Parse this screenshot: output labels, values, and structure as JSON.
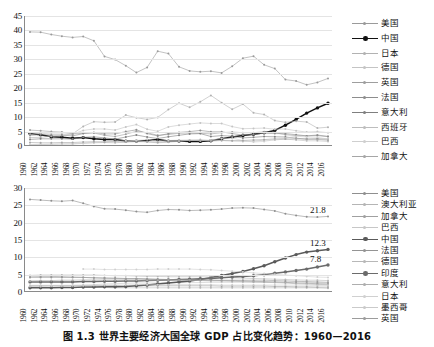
{
  "caption": "图 1.3    世界主要经济大国全球 GDP 占比变化趋势：1960—2016",
  "chart_data": [
    {
      "type": "line",
      "id": "chart-top",
      "title": "",
      "xlabel": "",
      "ylabel": "",
      "xlim": [
        1960,
        2016
      ],
      "ylim": [
        0,
        45
      ],
      "ytick_step": 5,
      "yticks": [
        "0",
        "5",
        "10",
        "15",
        "20",
        "25",
        "30",
        "35",
        "40",
        "45"
      ],
      "grid": true,
      "legend_position": "right",
      "x": [
        1960,
        1962,
        1964,
        1966,
        1968,
        1970,
        1972,
        1974,
        1976,
        1978,
        1980,
        1982,
        1984,
        1986,
        1988,
        1990,
        1992,
        1994,
        1996,
        1998,
        2000,
        2002,
        2004,
        2006,
        2008,
        2010,
        2012,
        2014,
        2016
      ],
      "xtick_labels": [
        "1960",
        "1962",
        "1964",
        "1966",
        "1968",
        "1970",
        "1972",
        "1974",
        "1976",
        "1978",
        "1980",
        "1982",
        "1984",
        "1986",
        "1988",
        "1990",
        "1992",
        "1994",
        "1996",
        "1998",
        "2000",
        "2002",
        "2004",
        "2006",
        "2008",
        "2010",
        "2012",
        "2014",
        "2016"
      ],
      "series": [
        {
          "name": "美国",
          "color": "#9a9a9a",
          "emphasis": false,
          "values": [
            39.5,
            39.4,
            38.6,
            38.0,
            37.6,
            37.9,
            36.4,
            31.0,
            29.9,
            27.8,
            25.4,
            27.2,
            32.8,
            32.0,
            27.4,
            26.0,
            25.7,
            25.9,
            25.3,
            27.6,
            30.4,
            31.1,
            28.1,
            26.8,
            23.0,
            22.5,
            21.2,
            22.0,
            23.4
          ]
        },
        {
          "name": "中国",
          "color": "#111111",
          "emphasis": true,
          "values": [
            4.3,
            3.9,
            3.2,
            3.0,
            2.7,
            2.9,
            2.5,
            2.3,
            2.2,
            1.7,
            1.7,
            1.9,
            2.2,
            1.7,
            1.7,
            1.6,
            1.6,
            1.8,
            2.5,
            3.1,
            3.6,
            4.1,
            4.6,
            5.4,
            7.2,
            9.2,
            11.4,
            13.2,
            14.8
          ]
        },
        {
          "name": "日本",
          "color": "#b2b2b2",
          "emphasis": false,
          "values": [
            2.9,
            3.0,
            3.4,
            3.6,
            4.2,
            6.8,
            8.4,
            8.2,
            8.3,
            10.7,
            9.8,
            9.2,
            9.9,
            12.6,
            14.8,
            13.4,
            15.3,
            17.5,
            15.0,
            12.7,
            14.5,
            11.5,
            10.9,
            8.8,
            8.2,
            8.6,
            8.3,
            6.2,
            6.5
          ]
        },
        {
          "name": "德国",
          "color": "#c4c4c4",
          "emphasis": false,
          "values": [
            4.1,
            4.4,
            4.2,
            4.2,
            4.0,
            5.4,
            5.9,
            5.9,
            5.5,
            6.6,
            7.4,
            5.8,
            5.1,
            6.6,
            7.2,
            7.6,
            8.0,
            7.8,
            7.8,
            6.7,
            6.0,
            6.1,
            6.2,
            5.8,
            5.9,
            5.3,
            4.8,
            5.0,
            4.6
          ]
        },
        {
          "name": "英国",
          "color": "#9e9e9e",
          "emphasis": false,
          "values": [
            5.5,
            5.3,
            5.0,
            4.8,
            4.2,
            4.4,
            4.5,
            3.7,
            3.3,
            4.1,
            5.1,
            4.6,
            3.7,
            4.0,
            4.4,
            4.5,
            4.4,
            4.2,
            4.6,
            4.8,
            4.6,
            4.6,
            4.9,
            4.6,
            3.9,
            3.6,
            3.5,
            3.8,
            3.3
          ]
        },
        {
          "name": "法国",
          "color": "#8d8d8d",
          "emphasis": false,
          "values": [
            3.7,
            3.9,
            3.8,
            3.8,
            3.5,
            4.3,
            4.7,
            4.2,
            4.2,
            5.0,
            5.6,
            4.3,
            3.5,
            4.3,
            4.7,
            5.0,
            5.4,
            4.9,
            4.9,
            4.3,
            3.8,
            4.0,
            4.4,
            4.3,
            4.3,
            3.9,
            3.5,
            3.6,
            3.3
          ]
        },
        {
          "name": "意大利",
          "color": "#7f7f7f",
          "emphasis": false,
          "values": [
            2.3,
            2.5,
            2.5,
            2.5,
            2.4,
            3.0,
            3.2,
            2.8,
            2.4,
            3.1,
            3.8,
            3.1,
            2.6,
            3.2,
            3.7,
            4.2,
            4.3,
            3.3,
            3.6,
            3.4,
            2.8,
            3.0,
            3.3,
            3.2,
            3.1,
            2.7,
            2.4,
            2.5,
            2.4
          ]
        },
        {
          "name": "西班牙",
          "color": "#bdbdbd",
          "emphasis": false,
          "values": [
            0.4,
            0.5,
            0.6,
            0.7,
            0.7,
            0.9,
            1.1,
            1.2,
            1.1,
            1.4,
            1.9,
            1.4,
            1.1,
            1.3,
            1.6,
            2.0,
            2.2,
            1.8,
            1.9,
            1.8,
            1.6,
            1.7,
            2.0,
            2.1,
            2.4,
            2.1,
            1.8,
            1.8,
            1.6
          ]
        },
        {
          "name": "巴西",
          "color": "#cfcfcf",
          "emphasis": false,
          "values": [
            0.5,
            0.6,
            0.6,
            0.7,
            0.8,
            1.0,
            1.2,
            1.5,
            1.6,
            1.8,
            1.9,
            2.2,
            1.6,
            1.9,
            2.0,
            2.1,
            1.8,
            2.1,
            2.6,
            2.7,
            1.9,
            1.4,
            1.6,
            2.2,
            2.7,
            3.4,
            3.1,
            3.0,
            2.4
          ]
        },
        {
          "name": "加拿大",
          "color": "#a6a6a6",
          "emphasis": false,
          "values": [
            1.2,
            1.1,
            1.1,
            1.2,
            1.2,
            1.4,
            1.5,
            1.4,
            1.5,
            1.4,
            1.5,
            1.5,
            1.3,
            1.5,
            1.8,
            1.9,
            1.9,
            1.8,
            1.9,
            1.8,
            1.9,
            2.1,
            2.2,
            2.5,
            2.4,
            2.5,
            2.4,
            2.3,
            2.0
          ]
        }
      ]
    },
    {
      "type": "line",
      "id": "chart-bottom",
      "title": "",
      "xlabel": "",
      "ylabel": "",
      "xlim": [
        1960,
        2016
      ],
      "ylim": [
        0,
        30
      ],
      "ytick_step": 5,
      "yticks": [
        "0",
        "5",
        "10",
        "15",
        "20",
        "25",
        "30"
      ],
      "grid": true,
      "legend_position": "right",
      "x": [
        1960,
        1962,
        1964,
        1966,
        1968,
        1970,
        1972,
        1974,
        1976,
        1978,
        1980,
        1982,
        1984,
        1986,
        1988,
        1990,
        1992,
        1994,
        1996,
        1998,
        2000,
        2002,
        2004,
        2006,
        2008,
        2010,
        2012,
        2014,
        2016
      ],
      "xtick_labels": [
        "1960",
        "1962",
        "1964",
        "1966",
        "1968",
        "1970",
        "1972",
        "1974",
        "1976",
        "1978",
        "1980",
        "1982",
        "1984",
        "1986",
        "1988",
        "1990",
        "1992",
        "1994",
        "1996",
        "1998",
        "2000",
        "2002",
        "2004",
        "2006",
        "2008",
        "2010",
        "2012",
        "2014",
        "2016"
      ],
      "annotations": [
        {
          "text": "21.8",
          "series": "美国",
          "x": 2016,
          "y": 21.8
        },
        {
          "text": "12.3",
          "series": "中国",
          "x": 2016,
          "y": 12.3
        },
        {
          "text": "7.8",
          "series": "印度",
          "x": 2016,
          "y": 7.8
        }
      ],
      "series": [
        {
          "name": "美国",
          "color": "#8f8f8f",
          "emphasis": false,
          "values": [
            26.7,
            26.5,
            26.3,
            26.2,
            26.4,
            25.6,
            24.7,
            24.0,
            23.9,
            23.6,
            23.2,
            23.0,
            23.5,
            23.8,
            23.7,
            23.5,
            23.6,
            23.7,
            23.9,
            24.2,
            24.3,
            24.2,
            23.8,
            23.4,
            22.6,
            22.1,
            21.7,
            21.6,
            21.8
          ]
        },
        {
          "name": "澳大利亚",
          "color": "#b5b5b5",
          "emphasis": false,
          "values": [
            1.3,
            1.3,
            1.3,
            1.3,
            1.3,
            1.3,
            1.3,
            1.3,
            1.2,
            1.2,
            1.2,
            1.2,
            1.2,
            1.2,
            1.2,
            1.2,
            1.2,
            1.2,
            1.2,
            1.2,
            1.2,
            1.2,
            1.2,
            1.2,
            1.2,
            1.2,
            1.2,
            1.2,
            1.1
          ]
        },
        {
          "name": "加拿大",
          "color": "#a0a0a0",
          "emphasis": false,
          "values": [
            1.9,
            1.9,
            1.9,
            1.9,
            1.9,
            1.9,
            1.9,
            1.9,
            1.9,
            1.8,
            1.8,
            1.8,
            1.8,
            1.8,
            1.8,
            1.8,
            1.8,
            1.8,
            1.7,
            1.7,
            1.7,
            1.7,
            1.7,
            1.6,
            1.6,
            1.5,
            1.5,
            1.4,
            1.4
          ]
        },
        {
          "name": "巴西",
          "color": "#c7c7c7",
          "emphasis": false,
          "values": [
            1.7,
            1.7,
            1.8,
            1.8,
            1.9,
            2.0,
            2.1,
            2.3,
            2.4,
            2.5,
            2.6,
            2.6,
            2.6,
            2.7,
            2.7,
            2.7,
            2.7,
            2.8,
            2.8,
            2.8,
            2.8,
            2.8,
            2.8,
            2.8,
            2.8,
            2.9,
            2.8,
            2.7,
            2.6
          ]
        },
        {
          "name": "中国",
          "color": "#5a5a5a",
          "emphasis": true,
          "values": [
            1.2,
            1.2,
            1.2,
            1.3,
            1.3,
            1.4,
            1.4,
            1.5,
            1.5,
            1.6,
            1.8,
            2.0,
            2.3,
            2.6,
            2.9,
            3.2,
            3.6,
            4.2,
            4.8,
            5.3,
            5.9,
            6.7,
            7.6,
            8.7,
            9.8,
            10.8,
            11.5,
            11.9,
            12.3
          ]
        },
        {
          "name": "法国",
          "color": "#949494",
          "emphasis": false,
          "values": [
            4.2,
            4.2,
            4.2,
            4.2,
            4.2,
            4.2,
            4.1,
            4.0,
            4.0,
            3.9,
            3.9,
            3.8,
            3.7,
            3.6,
            3.6,
            3.5,
            3.5,
            3.4,
            3.3,
            3.3,
            3.2,
            3.1,
            3.0,
            2.9,
            2.8,
            2.6,
            2.5,
            2.4,
            2.3
          ]
        },
        {
          "name": "德国",
          "color": "#b8b8b8",
          "emphasis": false,
          "values": [
            4.8,
            4.9,
            4.9,
            4.9,
            4.9,
            4.9,
            4.9,
            4.8,
            4.7,
            4.7,
            4.6,
            4.5,
            4.5,
            4.4,
            4.4,
            4.4,
            4.4,
            4.3,
            4.2,
            4.1,
            4.0,
            3.9,
            3.8,
            3.7,
            3.6,
            3.5,
            3.4,
            3.4,
            3.3
          ]
        },
        {
          "name": "印度",
          "color": "#6b6b6b",
          "emphasis": true,
          "values": [
            2.9,
            2.9,
            2.9,
            2.9,
            2.9,
            3.0,
            3.0,
            3.1,
            3.1,
            3.2,
            3.2,
            3.3,
            3.4,
            3.5,
            3.6,
            3.7,
            3.8,
            3.9,
            4.1,
            4.3,
            4.5,
            4.7,
            5.0,
            5.4,
            5.8,
            6.2,
            6.6,
            7.2,
            7.8
          ]
        },
        {
          "name": "意大利",
          "color": "#aeaeae",
          "emphasis": false,
          "values": [
            3.2,
            3.3,
            3.3,
            3.4,
            3.4,
            3.5,
            3.5,
            3.5,
            3.5,
            3.5,
            3.5,
            3.4,
            3.4,
            3.4,
            3.4,
            3.4,
            3.3,
            3.2,
            3.2,
            3.1,
            3.0,
            2.9,
            2.8,
            2.7,
            2.6,
            2.4,
            2.3,
            2.2,
            2.1
          ]
        },
        {
          "name": "日本",
          "color": "#d0d0d0",
          "emphasis": false,
          "values": [
            null,
            null,
            null,
            null,
            null,
            6.6,
            6.6,
            6.5,
            6.5,
            6.5,
            6.5,
            6.5,
            6.6,
            6.6,
            6.6,
            6.6,
            6.5,
            6.4,
            6.2,
            6.0,
            5.8,
            5.5,
            5.3,
            5.1,
            4.9,
            4.7,
            4.5,
            4.3,
            4.2
          ]
        },
        {
          "name": "墨西哥",
          "color": "#cacaca",
          "emphasis": false,
          "values": [
            1.6,
            1.6,
            1.7,
            1.7,
            1.8,
            1.8,
            1.9,
            1.9,
            2.0,
            2.0,
            2.1,
            2.1,
            2.1,
            2.1,
            2.1,
            2.1,
            2.1,
            2.1,
            2.0,
            2.0,
            2.0,
            2.0,
            2.0,
            2.0,
            2.0,
            2.0,
            2.0,
            1.9,
            1.9
          ]
        },
        {
          "name": "英国",
          "color": "#9c9c9c",
          "emphasis": false,
          "values": [
            4.6,
            4.5,
            4.5,
            4.4,
            4.3,
            4.2,
            4.1,
            4.0,
            3.9,
            3.8,
            3.8,
            3.7,
            3.6,
            3.6,
            3.5,
            3.5,
            3.4,
            3.4,
            3.4,
            3.4,
            3.4,
            3.4,
            3.4,
            3.3,
            3.2,
            3.1,
            3.0,
            2.9,
            2.8
          ]
        }
      ]
    }
  ]
}
